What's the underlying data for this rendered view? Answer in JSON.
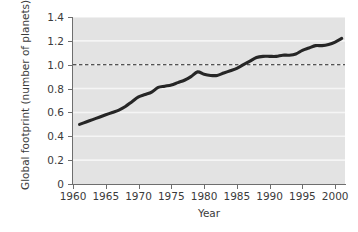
{
  "chart_data": {
    "type": "line",
    "title": "",
    "xlabel": "Year",
    "ylabel": "Global footprint (number of planets)",
    "xlim": [
      1960,
      2001.5
    ],
    "ylim": [
      0,
      1.4
    ],
    "grid": "horizontal-white",
    "legend": "none",
    "background_color": "#e3e3e3",
    "line_color": "#262626",
    "gridline_color": "#f5f5f5",
    "axis_color": "#6e6e6e",
    "x_ticks": [
      1960,
      1965,
      1970,
      1975,
      1980,
      1985,
      1990,
      1995,
      2000
    ],
    "x_tick_labels": [
      "1960",
      "1965",
      "1970",
      "1975",
      "1980",
      "1985",
      "1990",
      "1995",
      "2000"
    ],
    "y_ticks": [
      0,
      0.2,
      0.4,
      0.6,
      0.8,
      1.0,
      1.2,
      1.4
    ],
    "y_tick_labels": [
      "0",
      "0.2",
      "0.4",
      "0.6",
      "0.8",
      "1.0",
      "1.2",
      "1.4"
    ],
    "annotations": [
      {
        "name": "one-planet-reference-line",
        "type": "horizontal-dashed-line",
        "y": 1.0,
        "label": ""
      }
    ],
    "series": [
      {
        "name": "Global footprint",
        "style": "solid-thick",
        "x": [
          1961,
          1962,
          1963,
          1964,
          1965,
          1966,
          1967,
          1968,
          1969,
          1970,
          1971,
          1972,
          1973,
          1974,
          1975,
          1976,
          1977,
          1978,
          1979,
          1980,
          1981,
          1982,
          1983,
          1984,
          1985,
          1986,
          1987,
          1988,
          1989,
          1990,
          1991,
          1992,
          1993,
          1994,
          1995,
          1996,
          1997,
          1998,
          1999,
          2000,
          2001
        ],
        "values": [
          0.5,
          0.52,
          0.54,
          0.56,
          0.58,
          0.6,
          0.62,
          0.65,
          0.69,
          0.73,
          0.75,
          0.77,
          0.81,
          0.82,
          0.83,
          0.85,
          0.87,
          0.9,
          0.94,
          0.92,
          0.91,
          0.91,
          0.93,
          0.95,
          0.97,
          1.0,
          1.03,
          1.06,
          1.07,
          1.07,
          1.07,
          1.08,
          1.08,
          1.09,
          1.12,
          1.14,
          1.16,
          1.16,
          1.17,
          1.19,
          1.22
        ]
      }
    ]
  }
}
